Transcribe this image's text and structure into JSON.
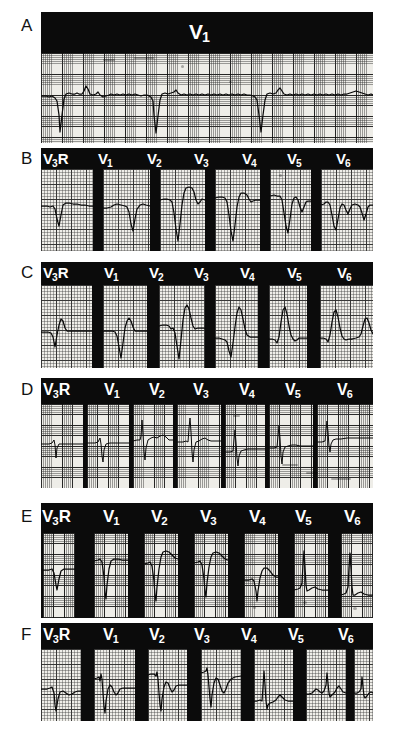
{
  "figure": {
    "type": "ecg-figure",
    "panel_count": 6,
    "background_color": "#ffffff",
    "band_color": "#0b0b0b",
    "trace_color": "#0a0a0a",
    "grid_paper_color": "#efeee9"
  },
  "panels": [
    {
      "letter": "A",
      "layout": "single-strip",
      "labels": [
        {
          "lead": "V",
          "sub": "1",
          "suffix": ""
        }
      ],
      "description": "Continuous rhythm strip, lead V1"
    },
    {
      "letter": "B",
      "layout": "seven-lead",
      "labels": [
        {
          "lead": "V",
          "sub": "3",
          "suffix": "R"
        },
        {
          "lead": "V",
          "sub": "1",
          "suffix": ""
        },
        {
          "lead": "V",
          "sub": "2",
          "suffix": ""
        },
        {
          "lead": "V",
          "sub": "3",
          "suffix": ""
        },
        {
          "lead": "V",
          "sub": "4",
          "suffix": ""
        },
        {
          "lead": "V",
          "sub": "5",
          "suffix": ""
        },
        {
          "lead": "V",
          "sub": "6",
          "suffix": ""
        }
      ],
      "description": "Deep QS complexes across precordial leads"
    },
    {
      "letter": "C",
      "layout": "seven-lead",
      "labels": [
        {
          "lead": "V",
          "sub": "3",
          "suffix": "R"
        },
        {
          "lead": "V",
          "sub": "1",
          "suffix": ""
        },
        {
          "lead": "V",
          "sub": "2",
          "suffix": ""
        },
        {
          "lead": "V",
          "sub": "3",
          "suffix": ""
        },
        {
          "lead": "V",
          "sub": "4",
          "suffix": ""
        },
        {
          "lead": "V",
          "sub": "5",
          "suffix": ""
        },
        {
          "lead": "V",
          "sub": "6",
          "suffix": ""
        }
      ],
      "description": "Tall upright R waves with small q waves"
    },
    {
      "letter": "D",
      "layout": "seven-lead",
      "labels": [
        {
          "lead": "V",
          "sub": "3",
          "suffix": "R"
        },
        {
          "lead": "V",
          "sub": "1",
          "suffix": ""
        },
        {
          "lead": "V",
          "sub": "2",
          "suffix": ""
        },
        {
          "lead": "V",
          "sub": "3",
          "suffix": ""
        },
        {
          "lead": "V",
          "sub": "4",
          "suffix": ""
        },
        {
          "lead": "V",
          "sub": "5",
          "suffix": ""
        },
        {
          "lead": "V",
          "sub": "6",
          "suffix": ""
        }
      ],
      "description": "Narrow low-amplitude spikes, thin dividers"
    },
    {
      "letter": "E",
      "layout": "seven-lead",
      "labels": [
        {
          "lead": "V",
          "sub": "3",
          "suffix": "R"
        },
        {
          "lead": "V",
          "sub": "1",
          "suffix": ""
        },
        {
          "lead": "V",
          "sub": "2",
          "suffix": ""
        },
        {
          "lead": "V",
          "sub": "3",
          "suffix": ""
        },
        {
          "lead": "V",
          "sub": "4",
          "suffix": ""
        },
        {
          "lead": "V",
          "sub": "5",
          "suffix": ""
        },
        {
          "lead": "V",
          "sub": "6",
          "suffix": ""
        }
      ],
      "description": "Deep S waves with ST elevation, dark grid paper"
    },
    {
      "letter": "F",
      "layout": "seven-lead",
      "labels": [
        {
          "lead": "V",
          "sub": "3",
          "suffix": "R"
        },
        {
          "lead": "V",
          "sub": "1",
          "suffix": ""
        },
        {
          "lead": "V",
          "sub": "2",
          "suffix": ""
        },
        {
          "lead": "V",
          "sub": "3",
          "suffix": ""
        },
        {
          "lead": "V",
          "sub": "4",
          "suffix": ""
        },
        {
          "lead": "V",
          "sub": "5",
          "suffix": ""
        },
        {
          "lead": "V",
          "sub": "6",
          "suffix": ""
        }
      ],
      "description": "QS right precordial leads, RS transition at V4-V6"
    }
  ]
}
